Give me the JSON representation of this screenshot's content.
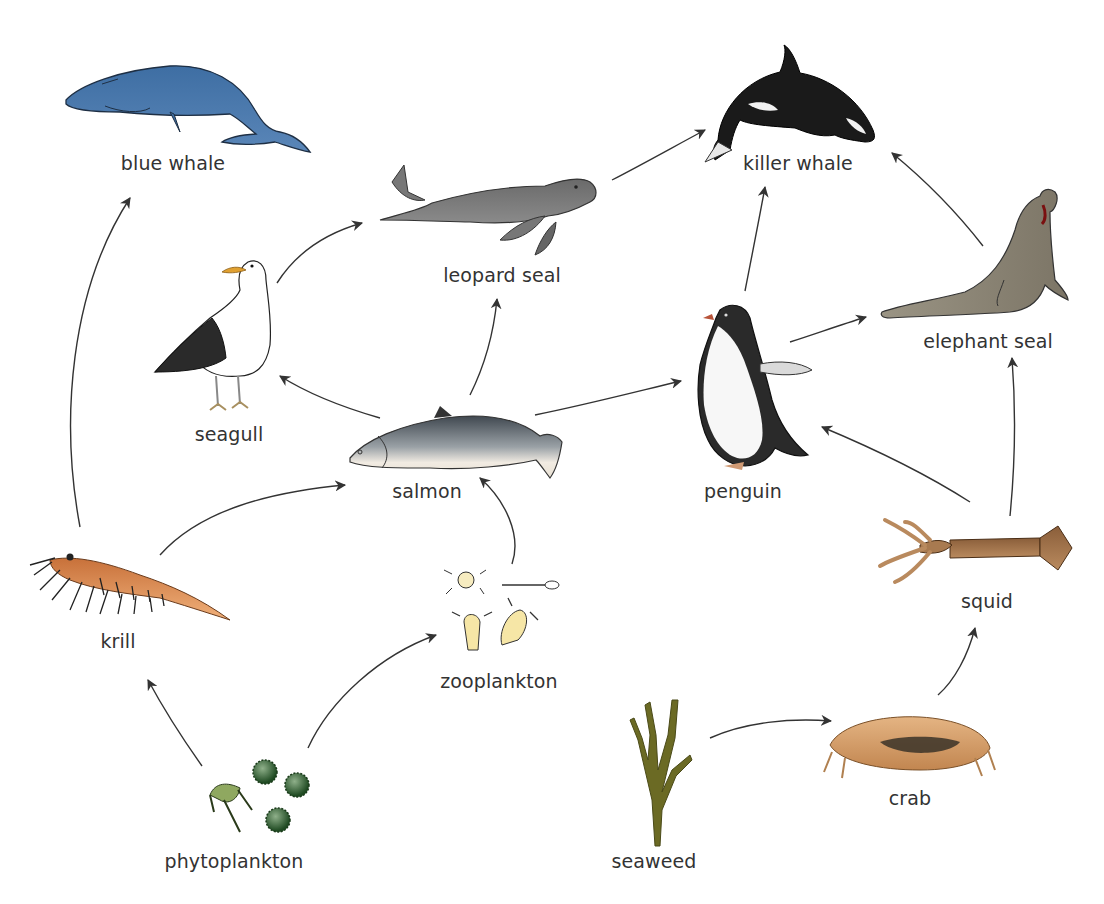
{
  "colors": {
    "arrow": "#333333",
    "label": "#333333",
    "background": "#ffffff"
  },
  "organisms": [
    {
      "id": "blue_whale",
      "label": "blue whale",
      "role": "consumer",
      "label_x": 173,
      "label_y": 152
    },
    {
      "id": "killer_whale",
      "label": "killer whale",
      "role": "apex predator",
      "label_x": 798,
      "label_y": 152
    },
    {
      "id": "leopard_seal",
      "label": "leopard seal",
      "role": "consumer",
      "label_x": 502,
      "label_y": 264
    },
    {
      "id": "elephant_seal",
      "label": "elephant seal",
      "role": "consumer",
      "label_x": 988,
      "label_y": 330
    },
    {
      "id": "seagull",
      "label": "seagull",
      "role": "consumer",
      "label_x": 229,
      "label_y": 423
    },
    {
      "id": "salmon",
      "label": "salmon",
      "role": "consumer",
      "label_x": 427,
      "label_y": 480
    },
    {
      "id": "penguin",
      "label": "penguin",
      "role": "consumer",
      "label_x": 743,
      "label_y": 480
    },
    {
      "id": "krill",
      "label": "krill",
      "role": "primary consumer",
      "label_x": 118,
      "label_y": 630
    },
    {
      "id": "zooplankton",
      "label": "zooplankton",
      "role": "primary consumer",
      "label_x": 499,
      "label_y": 670
    },
    {
      "id": "squid",
      "label": "squid",
      "role": "consumer",
      "label_x": 987,
      "label_y": 590
    },
    {
      "id": "phytoplankton",
      "label": "phytoplankton",
      "role": "producer",
      "label_x": 234,
      "label_y": 850
    },
    {
      "id": "seaweed",
      "label": "seaweed",
      "role": "producer",
      "label_x": 654,
      "label_y": 850
    },
    {
      "id": "crab",
      "label": "crab",
      "role": "consumer",
      "label_x": 910,
      "label_y": 787
    }
  ],
  "edges": [
    {
      "from": "krill",
      "to": "blue_whale"
    },
    {
      "from": "krill",
      "to": "salmon"
    },
    {
      "from": "phytoplankton",
      "to": "krill"
    },
    {
      "from": "phytoplankton",
      "to": "zooplankton"
    },
    {
      "from": "zooplankton",
      "to": "salmon"
    },
    {
      "from": "salmon",
      "to": "seagull"
    },
    {
      "from": "salmon",
      "to": "leopard_seal"
    },
    {
      "from": "salmon",
      "to": "penguin"
    },
    {
      "from": "seagull",
      "to": "leopard_seal"
    },
    {
      "from": "leopard_seal",
      "to": "killer_whale"
    },
    {
      "from": "penguin",
      "to": "killer_whale"
    },
    {
      "from": "penguin",
      "to": "elephant_seal"
    },
    {
      "from": "elephant_seal",
      "to": "killer_whale"
    },
    {
      "from": "squid",
      "to": "penguin"
    },
    {
      "from": "squid",
      "to": "elephant_seal"
    },
    {
      "from": "seaweed",
      "to": "crab"
    },
    {
      "from": "crab",
      "to": "squid"
    }
  ],
  "labels": {
    "blue_whale": "blue whale",
    "killer_whale": "killer whale",
    "leopard_seal": "leopard seal",
    "elephant_seal": "elephant seal",
    "seagull": "seagull",
    "salmon": "salmon",
    "penguin": "penguin",
    "krill": "krill",
    "zooplankton": "zooplankton",
    "squid": "squid",
    "phytoplankton": "phytoplankton",
    "seaweed": "seaweed",
    "crab": "crab"
  }
}
